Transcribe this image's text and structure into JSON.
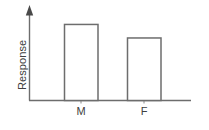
{
  "chart_data": {
    "type": "bar",
    "title": "",
    "subtitle": "",
    "xlabel": "",
    "ylabel": "Response",
    "categories": [
      "M",
      "F"
    ],
    "values": [
      90,
      74
    ],
    "ylim": [
      0,
      100
    ],
    "xlim": [
      0,
      100
    ],
    "grid": false,
    "legend": null,
    "legend_position": "none",
    "y_tick_labels": [],
    "x_tick_labels": [
      "M",
      "F"
    ],
    "annotations": [],
    "series": [
      {
        "name": "Response",
        "values": [
          90,
          74
        ]
      }
    ],
    "style": {
      "bar_fill": "#ffffff",
      "bar_stroke": "#6d6d6d",
      "axis_color": "#6d6d6d",
      "text_color": "#404040",
      "background": "#ffffff",
      "y_axis_has_arrow": true
    }
  },
  "axes": {
    "y_label_text": "Response",
    "category_labels": [
      "M",
      "F"
    ]
  }
}
